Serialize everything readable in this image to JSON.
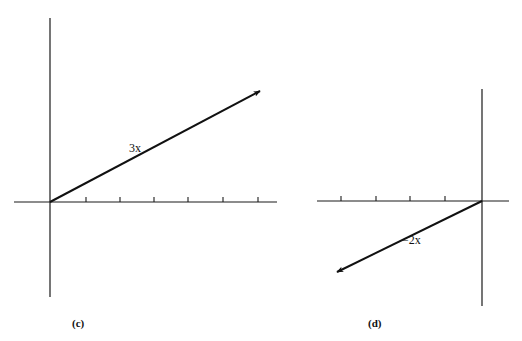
{
  "figures": [
    {
      "id": "c",
      "caption": "(c)",
      "vector_label": "3x",
      "scalar": 3,
      "origin": [
        50,
        202
      ],
      "x_axis": [
        14,
        277
      ],
      "y_axis": [
        18,
        297
      ],
      "ticks_x": [
        86,
        120,
        154,
        188,
        223,
        258
      ],
      "vector_tip": [
        260,
        91
      ],
      "label_pos": [
        129,
        152
      ],
      "caption_pos": [
        72,
        327
      ]
    },
    {
      "id": "d",
      "caption": "(d)",
      "vector_label": "−2x",
      "scalar": -2,
      "origin": [
        482,
        201
      ],
      "x_axis": [
        317,
        509
      ],
      "y_axis": [
        89,
        306
      ],
      "ticks_x": [
        341,
        376,
        410,
        445
      ],
      "vector_tip": [
        337,
        272
      ],
      "label_pos": [
        402,
        244
      ],
      "caption_pos": [
        368,
        327
      ]
    }
  ],
  "colors": {
    "ink": "#111111",
    "background": "#ffffff"
  }
}
